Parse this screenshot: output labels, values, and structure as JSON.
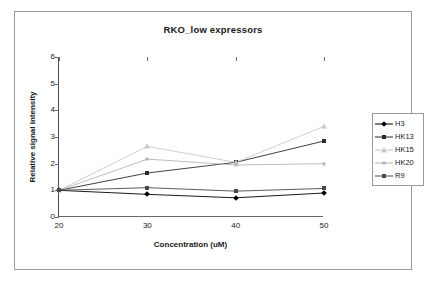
{
  "chart_data": {
    "type": "line",
    "title": "RKO_low expressors",
    "xlabel": "Concentration (uM)",
    "ylabel": "Relative signal intensity",
    "x": [
      20,
      30,
      40,
      50
    ],
    "xticklabels": [
      "20",
      "30",
      "40",
      "50"
    ],
    "yticklabels": [
      "0",
      "1",
      "2",
      "3",
      "4",
      "5",
      "6"
    ],
    "xlim": [
      20,
      50
    ],
    "ylim": [
      0,
      6
    ],
    "grid": false,
    "legend_position": "right",
    "series": [
      {
        "name": "H3",
        "values": [
          1.0,
          0.85,
          0.72,
          0.9
        ],
        "color": "#000000",
        "marker": "diamond"
      },
      {
        "name": "HK13",
        "values": [
          1.0,
          1.65,
          2.05,
          2.85
        ],
        "color": "#2b2b2b",
        "marker": "square"
      },
      {
        "name": "HK15",
        "values": [
          1.0,
          2.65,
          2.05,
          3.4
        ],
        "color": "#c9c9c9",
        "marker": "triangle"
      },
      {
        "name": "HK20",
        "values": [
          1.0,
          2.17,
          1.95,
          2.0
        ],
        "color": "#b5b5b5",
        "marker": "cross"
      },
      {
        "name": "R9",
        "values": [
          1.0,
          1.1,
          0.97,
          1.07
        ],
        "color": "#4a4a4a",
        "marker": "square"
      }
    ]
  }
}
